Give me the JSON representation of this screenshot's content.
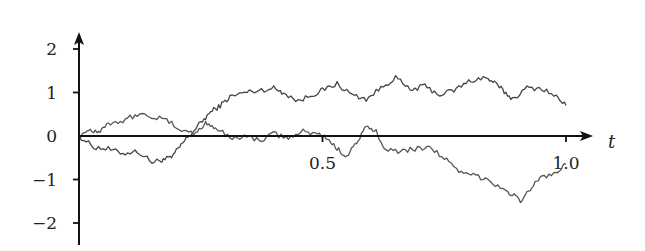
{
  "chart_data": {
    "type": "line",
    "title": "",
    "xlabel": "t",
    "ylabel": "",
    "xlim": [
      0,
      1.0
    ],
    "ylim": [
      -2.5,
      2.4
    ],
    "grid": false,
    "legend": null,
    "x_ticks": [
      {
        "value": 0.5,
        "label": "0.5"
      },
      {
        "value": 1.0,
        "label": "1.0"
      }
    ],
    "y_ticks": [
      {
        "value": 2,
        "label": "2"
      },
      {
        "value": 1,
        "label": "1"
      },
      {
        "value": 0,
        "label": "0"
      },
      {
        "value": -1,
        "label": "−1"
      },
      {
        "value": -2,
        "label": "−2"
      }
    ],
    "series": [
      {
        "name": "path-1",
        "color": "#444444",
        "x": [
          0,
          0.03,
          0.06,
          0.09,
          0.12,
          0.15,
          0.17,
          0.19,
          0.21,
          0.23,
          0.25,
          0.27,
          0.29,
          0.31,
          0.34,
          0.37,
          0.4,
          0.42,
          0.45,
          0.48,
          0.5,
          0.53,
          0.56,
          0.59,
          0.62,
          0.65,
          0.68,
          0.71,
          0.74,
          0.77,
          0.8,
          0.83,
          0.85,
          0.87,
          0.89,
          0.92,
          0.95,
          0.98,
          1.0
        ],
        "y": [
          0,
          -0.25,
          -0.3,
          -0.4,
          -0.35,
          -0.6,
          -0.55,
          -0.5,
          -0.2,
          0.05,
          0.3,
          0.55,
          0.7,
          0.9,
          1.0,
          1.05,
          1.1,
          1.0,
          0.8,
          0.95,
          1.05,
          1.2,
          0.95,
          0.85,
          1.1,
          1.35,
          1.05,
          1.15,
          0.95,
          1.05,
          1.25,
          1.35,
          1.25,
          1.05,
          0.85,
          1.1,
          1.1,
          0.9,
          0.7
        ]
      },
      {
        "name": "path-2",
        "color": "#555555",
        "x": [
          0,
          0.02,
          0.04,
          0.06,
          0.09,
          0.12,
          0.15,
          0.18,
          0.21,
          0.24,
          0.26,
          0.28,
          0.31,
          0.34,
          0.37,
          0.4,
          0.43,
          0.46,
          0.49,
          0.51,
          0.53,
          0.55,
          0.57,
          0.59,
          0.61,
          0.63,
          0.66,
          0.69,
          0.72,
          0.75,
          0.78,
          0.81,
          0.84,
          0.87,
          0.89,
          0.91,
          0.93,
          0.95,
          0.98,
          1.0
        ],
        "y": [
          0,
          0.15,
          0.1,
          0.3,
          0.35,
          0.5,
          0.45,
          0.35,
          0.15,
          0.05,
          0.3,
          0.2,
          -0.05,
          0.0,
          -0.1,
          0.05,
          -0.05,
          0.1,
          0.05,
          -0.05,
          -0.3,
          -0.45,
          -0.15,
          0.2,
          0.1,
          -0.3,
          -0.35,
          -0.3,
          -0.25,
          -0.5,
          -0.85,
          -0.9,
          -1.0,
          -1.2,
          -1.35,
          -1.5,
          -1.15,
          -0.95,
          -0.85,
          -0.65
        ]
      }
    ]
  },
  "axes": {
    "x_var_label": "t",
    "origin_label": "0"
  }
}
